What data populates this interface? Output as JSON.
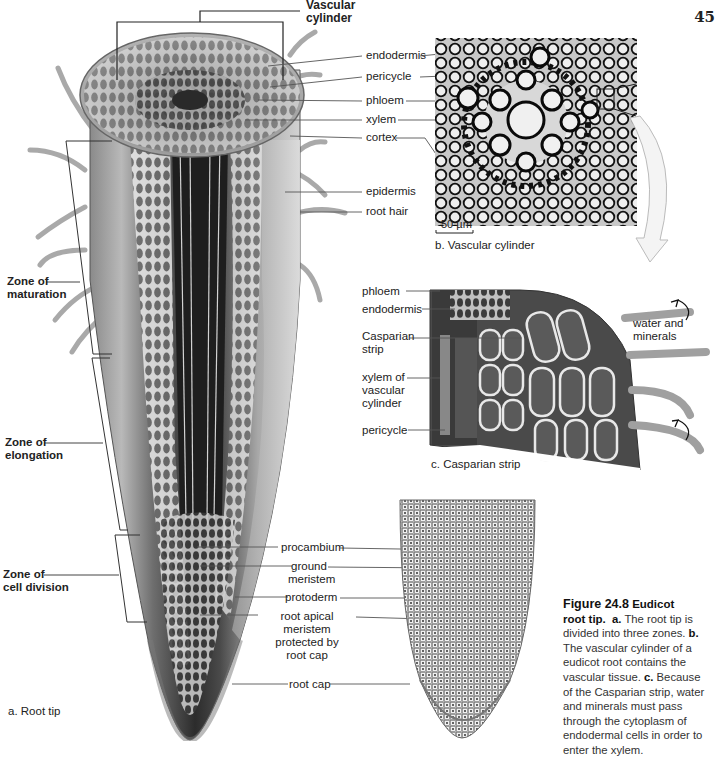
{
  "page": {
    "number": "45"
  },
  "panel_a": {
    "caption": "a. Root tip",
    "header": "Vascular\ncylinder",
    "labels": {
      "endodermis": "endodermis",
      "pericycle": "pericycle",
      "phloem": "phloem",
      "xylem": "xylem",
      "cortex": "cortex",
      "epidermis": "epidermis",
      "root_hair": "root hair",
      "procambium": "procambium",
      "ground_meristem": "ground\nmeristem",
      "protoderm": "protoderm",
      "root_apical_meristem": "root apical meristem\nprotected by\nroot cap",
      "root_cap": "root cap"
    },
    "zones": [
      {
        "id": "maturation",
        "label": "Zone of\nmaturation"
      },
      {
        "id": "elongation",
        "label": "Zone of\nelongation"
      },
      {
        "id": "cell-division",
        "label": "Zone of\ncell division"
      }
    ]
  },
  "panel_b": {
    "caption": "b. Vascular cylinder",
    "scale_bar": "50 µm"
  },
  "panel_c": {
    "caption": "c. Casparian strip",
    "labels": {
      "phloem": "phloem",
      "endodermis": "endodermis",
      "casparian_strip": "Casparian\nstrip",
      "xylem": "xylem of\nvascular\ncylinder",
      "pericycle": "pericycle",
      "water": "water and\nminerals"
    }
  },
  "figure_caption": {
    "title": "Figure 24.8",
    "title_rest": "Eudicot",
    "title_line2": "root tip.",
    "a_marker": "a.",
    "a_text": "The root tip is divided into three zones.",
    "b_marker": "b.",
    "b_text": "The vascular cylinder of a eudicot root contains the vascular tissue.",
    "c_marker": "c.",
    "c_text": "Because of the Casparian strip, water and minerals must pass through the cytoplasm of endodermal cells in order to enter the xylem."
  }
}
